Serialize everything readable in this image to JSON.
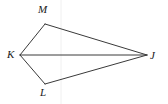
{
  "figure": {
    "name": "quadrilateral-MKLJ",
    "background_color": "#ffffff",
    "stroke_color": "#3a3a3a",
    "guide_color": "#f0f0f0",
    "stroke_width": 1,
    "labels": {
      "m": "M",
      "k": "K",
      "j": "J",
      "l": "L"
    },
    "vertices": {
      "M": {
        "x": 45,
        "y": 24
      },
      "K": {
        "x": 20,
        "y": 55
      },
      "J": {
        "x": 147,
        "y": 55
      },
      "L": {
        "x": 45,
        "y": 84
      }
    },
    "edges": [
      {
        "name": "segment-KM",
        "from": "K",
        "to": "M"
      },
      {
        "name": "segment-MJ",
        "from": "M",
        "to": "J"
      },
      {
        "name": "segment-KJ",
        "from": "K",
        "to": "J"
      },
      {
        "name": "segment-KL",
        "from": "K",
        "to": "L"
      },
      {
        "name": "segment-LJ",
        "from": "L",
        "to": "J"
      }
    ],
    "guideline": {
      "name": "vertical-guide",
      "x": 61,
      "y1": 0,
      "y2": 104
    }
  }
}
